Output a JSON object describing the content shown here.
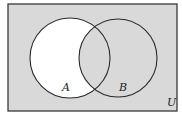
{
  "diagram": {
    "type": "venn",
    "universe": {
      "label": "U",
      "x": 8,
      "y": 4,
      "width": 169,
      "height": 107,
      "fill": "#d9d9d9",
      "stroke": "#3a3a3a"
    },
    "sets": [
      {
        "label": "A",
        "cx": 70,
        "cy": 58,
        "r": 40,
        "label_x": 65,
        "label_y": 91
      },
      {
        "label": "B",
        "cx": 118,
        "cy": 58,
        "r": 39,
        "label_x": 122,
        "label_y": 91
      }
    ],
    "unshaded_region": "A only (A − B)",
    "unshaded_fill": "#ffffff",
    "stroke_color": "#2a2a2a",
    "universe_label_pos": {
      "x": 170,
      "y": 106
    }
  }
}
